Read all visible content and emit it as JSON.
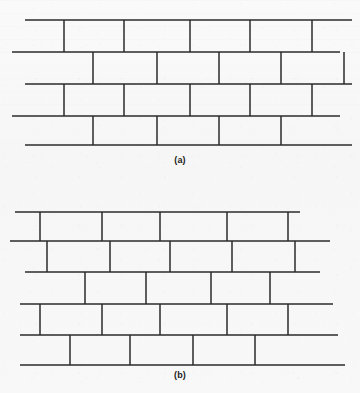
{
  "page": {
    "background_color": "#f8f8f8",
    "line_color": "#2b2b2b",
    "width": 360,
    "height": 393
  },
  "figures": [
    {
      "id": "figure-a",
      "caption": "(a)",
      "description": "running-bond masonry wall elevation with uniformly staggered vertical head joints",
      "origin_y": 0,
      "bed_joints": [
        {
          "name": "course-top",
          "y": 20,
          "x1": 25,
          "x2": 352
        },
        {
          "name": "course-1-bottom",
          "y": 52,
          "x1": 12,
          "x2": 340
        },
        {
          "name": "course-2-bottom",
          "y": 84,
          "x1": 25,
          "x2": 352
        },
        {
          "name": "course-3-bottom",
          "y": 116,
          "x1": 12,
          "x2": 340
        },
        {
          "name": "course-4-bottom",
          "y": 145,
          "x1": 25,
          "x2": 352
        }
      ],
      "head_joints": [
        {
          "course": 1,
          "y1": 20,
          "y2": 52,
          "x": [
            64,
            124,
            190,
            250,
            312
          ]
        },
        {
          "course": 2,
          "y1": 52,
          "y2": 84,
          "x": [
            93,
            157,
            219,
            281,
            344
          ]
        },
        {
          "course": 3,
          "y1": 84,
          "y2": 116,
          "x": [
            64,
            124,
            190,
            250,
            312
          ]
        },
        {
          "course": 4,
          "y1": 116,
          "y2": 145,
          "x": [
            93,
            157,
            219,
            281
          ]
        }
      ]
    },
    {
      "id": "figure-b",
      "caption": "(b)",
      "description": "irregular stretcher-bond masonry wall elevation with variable brick lengths and offsets",
      "origin_y": 190,
      "bed_joints": [
        {
          "name": "course-top",
          "y": 212,
          "x1": 15,
          "x2": 300
        },
        {
          "name": "course-1-bottom",
          "y": 241,
          "x1": 10,
          "x2": 330
        },
        {
          "name": "course-2-bottom",
          "y": 272,
          "x1": 25,
          "x2": 320
        },
        {
          "name": "course-3-bottom",
          "y": 304,
          "x1": 20,
          "x2": 333
        },
        {
          "name": "course-4-bottom",
          "y": 335,
          "x1": 20,
          "x2": 338
        },
        {
          "name": "course-5-bottom",
          "y": 365,
          "x1": 20,
          "x2": 345
        }
      ],
      "head_joints": [
        {
          "course": 1,
          "y1": 212,
          "y2": 241,
          "x": [
            40,
            102,
            160,
            227,
            288
          ]
        },
        {
          "course": 2,
          "y1": 241,
          "y2": 272,
          "x": [
            47,
            110,
            170,
            232,
            295
          ]
        },
        {
          "course": 3,
          "y1": 272,
          "y2": 304,
          "x": [
            85,
            146,
            211,
            270
          ]
        },
        {
          "course": 4,
          "y1": 304,
          "y2": 335,
          "x": [
            40,
            102,
            160,
            227,
            288
          ]
        },
        {
          "course": 5,
          "y1": 335,
          "y2": 365,
          "x": [
            70,
            130,
            193,
            255
          ]
        }
      ]
    }
  ]
}
